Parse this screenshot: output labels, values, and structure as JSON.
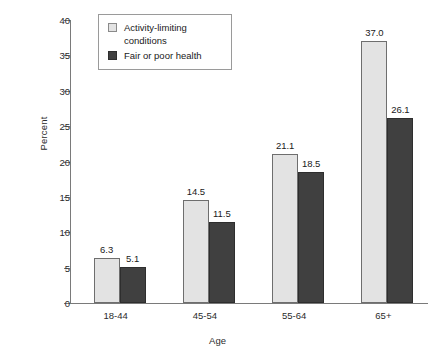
{
  "chart_data": {
    "type": "bar",
    "title": "",
    "subtitle": "",
    "xlabel": "Age",
    "ylabel": "Percent",
    "categories": [
      "18-44",
      "45-54",
      "55-64",
      "65+"
    ],
    "series": [
      {
        "name": "Activity-limiting conditions",
        "color": "#e3e3e3",
        "values": [
          6.3,
          14.5,
          21.1,
          37.0
        ],
        "labels": [
          "6.3",
          "14.5",
          "21.1",
          "37.0"
        ]
      },
      {
        "name": "Fair or poor health",
        "color": "#404040",
        "values": [
          5.1,
          11.5,
          18.5,
          26.1
        ],
        "labels": [
          "5.1",
          "11.5",
          "18.5",
          "26.1"
        ]
      }
    ],
    "ylim": [
      0,
      40
    ],
    "yticks": [
      0,
      5,
      10,
      15,
      20,
      25,
      30,
      35,
      40
    ],
    "ytick_labels": [
      "0",
      "5",
      "10",
      "15",
      "20",
      "25",
      "30",
      "35",
      "40"
    ],
    "grid": false,
    "legend_position": "top-left"
  },
  "legend": {
    "entries": [
      {
        "label": "Activity-limiting conditions",
        "swatch": "light-gray-swatch-icon"
      },
      {
        "label": "Fair or poor health",
        "swatch": "dark-gray-swatch-icon"
      }
    ]
  }
}
